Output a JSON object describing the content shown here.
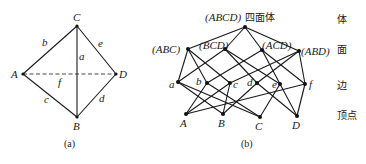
{
  "figure_a": {
    "caption": "(a)",
    "vertices": [
      {
        "id": "C",
        "label": "C",
        "x": 77,
        "y": 26,
        "lx": 73,
        "ly": 21
      },
      {
        "id": "A",
        "label": "A",
        "x": 23,
        "y": 74,
        "lx": 11,
        "ly": 78
      },
      {
        "id": "D",
        "label": "D",
        "x": 116,
        "y": 74,
        "lx": 119,
        "ly": 78
      },
      {
        "id": "B",
        "label": "B",
        "x": 77,
        "y": 117,
        "lx": 73,
        "ly": 130
      }
    ],
    "edges": [
      {
        "from": "C",
        "to": "A",
        "label": "b",
        "lx": 42,
        "ly": 46,
        "style": "solid"
      },
      {
        "from": "C",
        "to": "D",
        "label": "e",
        "lx": 98,
        "ly": 47,
        "style": "solid"
      },
      {
        "from": "C",
        "to": "B",
        "label": "a",
        "lx": 79,
        "ly": 60,
        "style": "solid"
      },
      {
        "from": "A",
        "to": "B",
        "label": "c",
        "lx": 44,
        "ly": 103,
        "style": "solid"
      },
      {
        "from": "D",
        "to": "B",
        "label": "d",
        "lx": 99,
        "ly": 102,
        "style": "solid"
      },
      {
        "from": "A",
        "to": "D",
        "label": "f",
        "lx": 58,
        "ly": 86,
        "style": "dashed"
      }
    ]
  },
  "figure_b": {
    "caption": "(b)",
    "title_suffix": "四面体",
    "row_labels": [
      {
        "text": "体",
        "y": 23
      },
      {
        "text": "面",
        "y": 53
      },
      {
        "text": "边",
        "y": 89
      },
      {
        "text": "顶点",
        "y": 119
      }
    ],
    "nodes": [
      {
        "id": "ABCD",
        "label": "(ABCD)",
        "x": 245,
        "y": 27,
        "lx": 205,
        "ly": 21,
        "anchor": "start"
      },
      {
        "id": "ABC",
        "label": "(ABC)",
        "x": 188,
        "y": 49,
        "lx": 152,
        "ly": 53,
        "anchor": "start"
      },
      {
        "id": "BCD",
        "label": "(BCD)",
        "x": 225,
        "y": 49,
        "lx": 199,
        "ly": 49,
        "anchor": "start"
      },
      {
        "id": "ACD",
        "label": "(ACD)",
        "x": 262,
        "y": 50,
        "lx": 262,
        "ly": 49,
        "anchor": "start"
      },
      {
        "id": "ABD",
        "label": "(ABD)",
        "x": 299,
        "y": 51,
        "lx": 301,
        "ly": 55,
        "anchor": "start"
      },
      {
        "id": "a",
        "label": "a",
        "x": 178,
        "y": 82,
        "lx": 169,
        "ly": 88,
        "anchor": "start"
      },
      {
        "id": "b",
        "label": "b",
        "x": 207,
        "y": 83,
        "lx": 196,
        "ly": 85,
        "anchor": "start"
      },
      {
        "id": "c",
        "label": "c",
        "x": 230,
        "y": 83,
        "lx": 233,
        "ly": 88,
        "anchor": "start"
      },
      {
        "id": "d",
        "label": "d",
        "x": 257,
        "y": 83,
        "lx": 247,
        "ly": 86,
        "anchor": "start"
      },
      {
        "id": "e",
        "label": "e",
        "x": 280,
        "y": 84,
        "lx": 272,
        "ly": 88,
        "anchor": "start"
      },
      {
        "id": "f",
        "label": "f",
        "x": 305,
        "y": 84,
        "lx": 309,
        "ly": 88,
        "anchor": "start"
      },
      {
        "id": "A",
        "label": "A",
        "x": 186,
        "y": 114,
        "lx": 180,
        "ly": 127,
        "anchor": "start"
      },
      {
        "id": "B",
        "label": "B",
        "x": 223,
        "y": 114,
        "lx": 218,
        "ly": 127,
        "anchor": "start"
      },
      {
        "id": "C",
        "label": "C",
        "x": 260,
        "y": 117,
        "lx": 255,
        "ly": 130,
        "anchor": "start"
      },
      {
        "id": "D",
        "label": "D",
        "x": 297,
        "y": 116,
        "lx": 292,
        "ly": 129,
        "anchor": "start"
      }
    ],
    "edges": [
      [
        "ABCD",
        "ABC"
      ],
      [
        "ABCD",
        "BCD"
      ],
      [
        "ABCD",
        "ACD"
      ],
      [
        "ABCD",
        "ABD"
      ],
      [
        "ABC",
        "a"
      ],
      [
        "ABC",
        "b"
      ],
      [
        "ABC",
        "c"
      ],
      [
        "BCD",
        "a"
      ],
      [
        "BCD",
        "d"
      ],
      [
        "BCD",
        "e"
      ],
      [
        "ACD",
        "b"
      ],
      [
        "ACD",
        "e"
      ],
      [
        "ACD",
        "f"
      ],
      [
        "ABD",
        "c"
      ],
      [
        "ABD",
        "d"
      ],
      [
        "ABD",
        "f"
      ],
      [
        "a",
        "B"
      ],
      [
        "a",
        "C"
      ],
      [
        "b",
        "A"
      ],
      [
        "b",
        "C"
      ],
      [
        "c",
        "A"
      ],
      [
        "c",
        "B"
      ],
      [
        "d",
        "B"
      ],
      [
        "d",
        "D"
      ],
      [
        "e",
        "C"
      ],
      [
        "e",
        "D"
      ],
      [
        "f",
        "A"
      ],
      [
        "f",
        "D"
      ]
    ]
  }
}
